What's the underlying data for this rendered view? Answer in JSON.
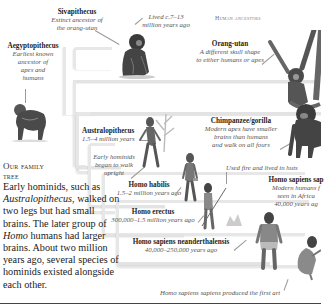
{
  "page": {
    "header": "Human ancestors",
    "intro": {
      "heading_line1": "Our family",
      "heading_line2": "tree",
      "body_before_italic": "Early hominids, such as",
      "body_italic": "Australopithecus",
      "body_after_italic": ", walked on two legs but had small brains. The later group of",
      "body_italic2": "Homo",
      "body_after_italic2": "humans had larger brains. About two million years ago, several species of hominids existed alongside each other."
    }
  },
  "species": {
    "sivapithecus": {
      "name": "Sivapithecus",
      "desc_line1": "Extinct ancestor of",
      "desc_line2": "the orang-utan",
      "note_line1": "Lived c.7–13",
      "note_line2": "million years ago"
    },
    "aegyptopithecus": {
      "name": "Aegyptopithecus",
      "desc_lines": [
        "Earliest known",
        "ancestor of",
        "apes and",
        "humans"
      ]
    },
    "orangutan": {
      "name": "Orang-utan",
      "desc_line1": "A different skull shape",
      "desc_line2": "to either humans or apes"
    },
    "australopithecus": {
      "name": "Australopithecus",
      "age": "1.5–4 million years",
      "note_lines": [
        "Early hominids",
        "began to walk",
        "upright"
      ]
    },
    "chimp_gorilla": {
      "name": "Chimpanzee/gorilla",
      "desc_lines": [
        "Modern apes have smaller",
        "brains than humans",
        "and walk on all fours"
      ]
    },
    "homo_habilis": {
      "name": "Homo habilis",
      "age": "1.5–2 million years ago"
    },
    "homo_erectus": {
      "name": "Homo erectus",
      "age": "300,000–1.5 million years ago",
      "note": "Used fire and lived in huts"
    },
    "homo_sapiens_sapiens": {
      "name": "Homo sapiens sap",
      "desc_lines": [
        "Modern humans f",
        "seen in Africa",
        "40,000 years ag"
      ],
      "note": "Homo sapiens sapiens produced the first art"
    },
    "neanderthal": {
      "name": "Homo sapiens neanderthalensis",
      "age": "40,000–250,000 years ago"
    }
  },
  "colors": {
    "branch": "#e7e7e7",
    "text": "#222222",
    "italic_text": "#555555",
    "rule": "#444444"
  }
}
